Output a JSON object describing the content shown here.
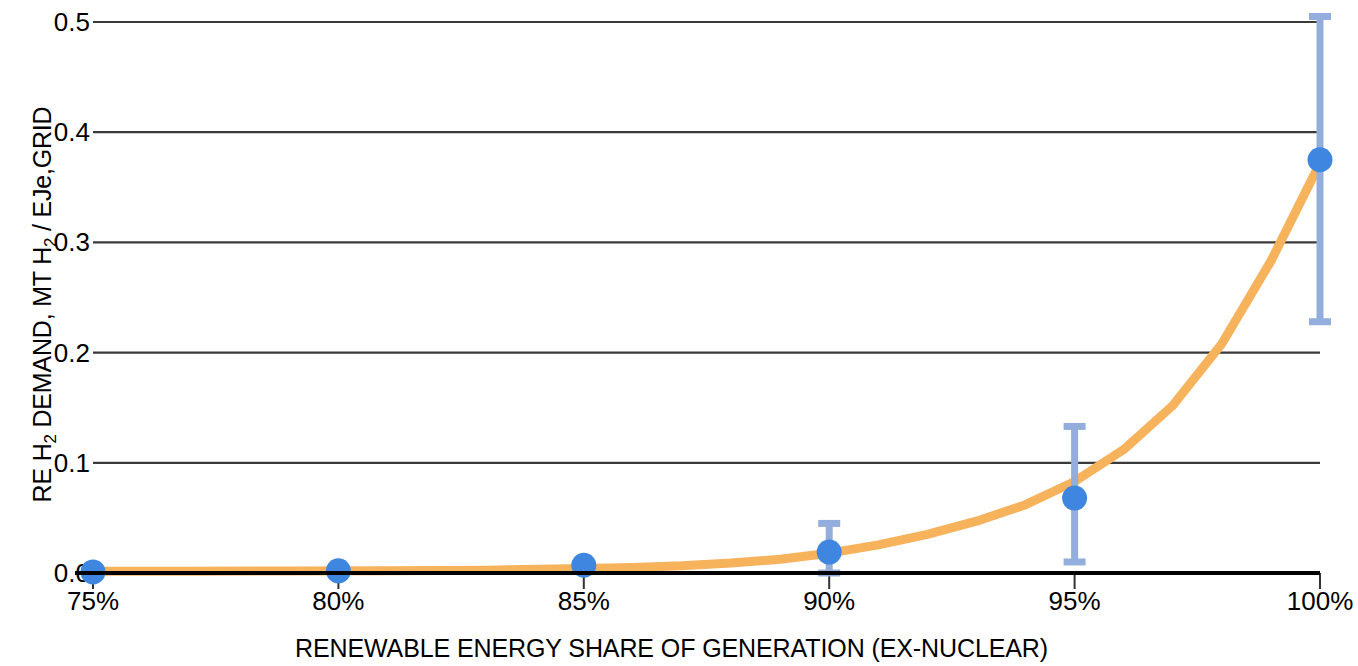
{
  "chart_data": {
    "type": "scatter",
    "title": "",
    "subtitle": "",
    "xlabel": "RENEWABLE ENERGY SHARE OF GENERATION (EX-NUCLEAR)",
    "ylabel": "RE H2 DEMAND, MT H2 / EJe,GRID",
    "ylabel_parts": {
      "a": "RE H",
      "sub1": "2",
      "b": " DEMAND, MT H",
      "sub2": "2",
      "c": " / EJe,GRID"
    },
    "x": [
      75,
      80,
      85,
      90,
      95,
      100
    ],
    "x_tick_labels": [
      "75%",
      "80%",
      "85%",
      "90%",
      "95%",
      "100%"
    ],
    "y_tick_labels": [
      "0.0",
      "0.1",
      "0.2",
      "0.3",
      "0.4",
      "0.5"
    ],
    "y_tick_values": [
      0.0,
      0.1,
      0.2,
      0.3,
      0.4,
      0.5
    ],
    "xlim": [
      75,
      100
    ],
    "ylim": [
      0.0,
      0.5
    ],
    "grid": "horizontal",
    "legend": "none",
    "series": [
      {
        "name": "RE H2 demand",
        "type": "scatter-errorbar",
        "marker_color": "#3f86e0",
        "errorbar_color": "#93aedd",
        "values": [
          0.001,
          0.002,
          0.007,
          0.019,
          0.068,
          0.375
        ],
        "err_low": [
          0.001,
          0.002,
          0.007,
          0.0,
          0.01,
          0.228
        ],
        "err_high": [
          0.001,
          0.002,
          0.007,
          0.045,
          0.133,
          0.505
        ]
      },
      {
        "name": "Exponential fit",
        "type": "line",
        "line_color": "#f7b25c",
        "x": [
          75,
          77,
          79,
          81,
          83,
          85,
          86,
          87,
          88,
          89,
          90,
          91,
          92,
          93,
          94,
          95,
          96,
          97,
          98,
          99,
          100
        ],
        "values": [
          0.0015,
          0.0016,
          0.0018,
          0.002,
          0.0025,
          0.004,
          0.005,
          0.0065,
          0.009,
          0.0125,
          0.018,
          0.0255,
          0.035,
          0.047,
          0.062,
          0.083,
          0.112,
          0.152,
          0.208,
          0.283,
          0.372
        ]
      }
    ],
    "colors": {
      "marker": "#3f86e0",
      "errorbar": "#93aedd",
      "curve": "#f7b25c",
      "grid": "#3a3a3a",
      "axis": "#000000",
      "background": "#ffffff"
    }
  }
}
